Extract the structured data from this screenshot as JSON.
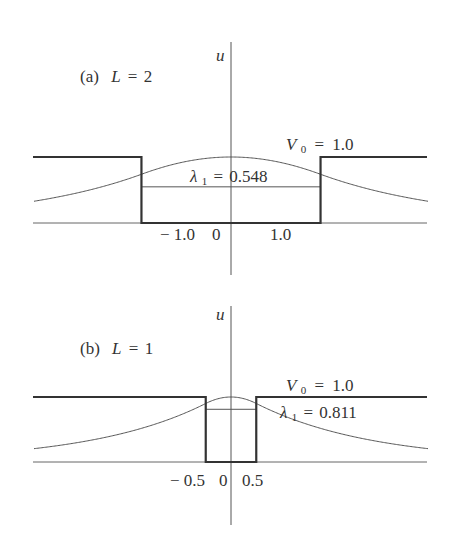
{
  "chart_data": [
    {
      "type": "line",
      "panel": "a",
      "label_prefix": "(a)",
      "label_var": "L",
      "label_value": "2",
      "title": "(a) L = 2",
      "ylabel": "u",
      "potential_label_var": "V",
      "potential_label_sub": "0",
      "potential_label_value": "1.0",
      "V0": 1.0,
      "well_half_width": 1.0,
      "eigen_label_var": "λ",
      "eigen_label_sub": "1",
      "eigen_label_value": "0.548",
      "lambda1": 0.548,
      "xticks": [
        "− 1.0",
        "0",
        "1.0"
      ],
      "xrange": [
        -2.2,
        2.2
      ],
      "series": [
        {
          "name": "potential V(x)",
          "style": "thick step"
        },
        {
          "name": "ground-state wavefunction u(x)",
          "style": "thin curve",
          "peak": 1.0
        },
        {
          "name": "energy level λ1",
          "style": "thin horizontal line inside well"
        }
      ]
    },
    {
      "type": "line",
      "panel": "b",
      "label_prefix": "(b)",
      "label_var": "L",
      "label_value": "1",
      "title": "(b) L = 1",
      "ylabel": "u",
      "potential_label_var": "V",
      "potential_label_sub": "0",
      "potential_label_value": "1.0",
      "V0": 1.0,
      "well_half_width": 0.5,
      "eigen_label_var": "λ",
      "eigen_label_sub": "1",
      "eigen_label_value": "0.811",
      "lambda1": 0.811,
      "xticks": [
        "− 0.5",
        "0",
        "0.5"
      ],
      "xrange": [
        -3.9,
        3.9
      ],
      "series": [
        {
          "name": "potential V(x)",
          "style": "thick step"
        },
        {
          "name": "ground-state wavefunction u(x)",
          "style": "thin curve",
          "peak": 1.0
        },
        {
          "name": "energy level λ1",
          "style": "thin horizontal line inside well"
        }
      ]
    }
  ]
}
